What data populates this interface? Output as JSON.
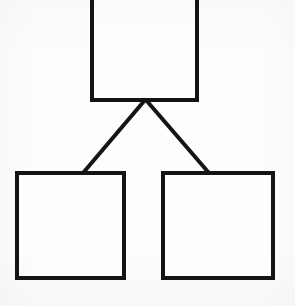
{
  "document": {
    "kind": "hand-drawn-diagram",
    "title": "",
    "background_color": "#fdfdfd",
    "ink_color": "#141414",
    "stroke_width_px": 4,
    "canvas": {
      "width": 295,
      "height": 306
    }
  },
  "diagram": {
    "type": "tree",
    "orientation": "top-down",
    "node_count": 3,
    "edge_count": 2,
    "nodes": [
      {
        "id": "root",
        "shape": "rectangle",
        "label": "",
        "role": "parent",
        "clipped_at_top_edge": true,
        "x": 92,
        "y": -12,
        "width": 105,
        "height": 112
      },
      {
        "id": "child-left",
        "shape": "rectangle",
        "label": "",
        "role": "child",
        "clipped_at_top_edge": false,
        "x": 17,
        "y": 173,
        "width": 107,
        "height": 105
      },
      {
        "id": "child-right",
        "shape": "rectangle",
        "label": "",
        "role": "child",
        "clipped_at_top_edge": false,
        "x": 163,
        "y": 173,
        "width": 110,
        "height": 105
      }
    ],
    "edges": [
      {
        "id": "edge-root-left",
        "from": "root",
        "to": "child-left",
        "label": "",
        "style": "straight",
        "x1": 145,
        "y1": 100,
        "x2": 83,
        "y2": 173
      },
      {
        "id": "edge-root-right",
        "from": "root",
        "to": "child-right",
        "label": "",
        "style": "straight",
        "x1": 146,
        "y1": 100,
        "x2": 209,
        "y2": 173
      }
    ]
  }
}
